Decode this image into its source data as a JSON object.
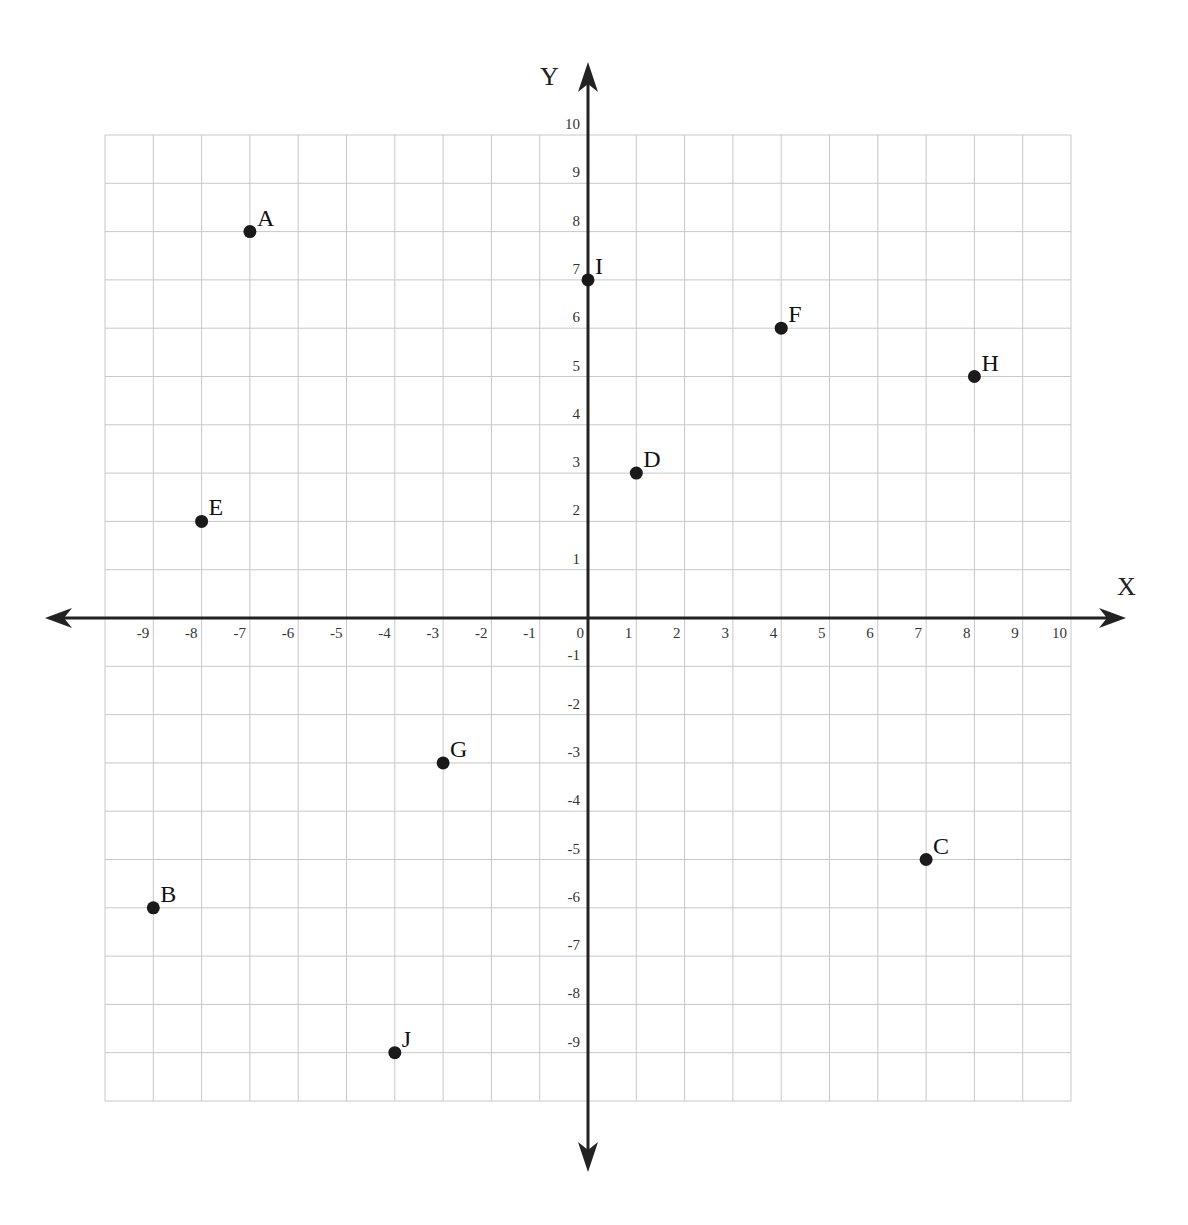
{
  "chart_data": {
    "type": "scatter",
    "title": "",
    "xlabel": "X",
    "ylabel": "Y",
    "xlim": [
      -10,
      10
    ],
    "ylim": [
      -10,
      10
    ],
    "grid": true,
    "legend": null,
    "x_ticks": [
      -9,
      -8,
      -7,
      -6,
      -5,
      -4,
      -3,
      -2,
      -1,
      0,
      1,
      2,
      3,
      4,
      5,
      6,
      7,
      8,
      9,
      10
    ],
    "y_ticks": [
      10,
      9,
      8,
      7,
      6,
      5,
      4,
      3,
      2,
      1,
      -1,
      -2,
      -3,
      -4,
      -5,
      -6,
      -7,
      -8,
      -9
    ],
    "points": [
      {
        "label": "A",
        "x": -7,
        "y": 8
      },
      {
        "label": "B",
        "x": -9,
        "y": -6
      },
      {
        "label": "C",
        "x": 7,
        "y": -5
      },
      {
        "label": "D",
        "x": 1,
        "y": 3
      },
      {
        "label": "E",
        "x": -8,
        "y": 2
      },
      {
        "label": "F",
        "x": 4,
        "y": 6
      },
      {
        "label": "G",
        "x": -3,
        "y": -3
      },
      {
        "label": "H",
        "x": 8,
        "y": 5
      },
      {
        "label": "I",
        "x": 0,
        "y": 7
      },
      {
        "label": "J",
        "x": -4,
        "y": -9
      }
    ]
  },
  "colors": {
    "grid": "#c8c8c8",
    "axis": "#222222",
    "point": "#1a1a1a"
  }
}
